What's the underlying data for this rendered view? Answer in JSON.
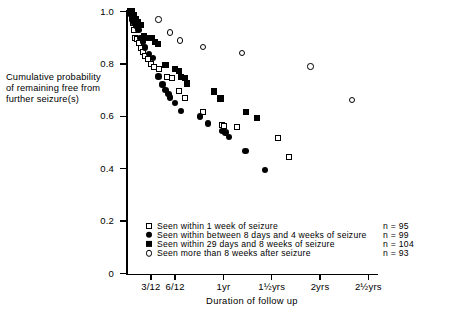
{
  "chart_data": {
    "type": "scatter",
    "title": "",
    "xlabel": "Duration of follow up",
    "ylabel": "Cumulative probability of remaining free from further seizure(s)",
    "ylabel_lines": [
      "Cumulative probability",
      "of remaining free from",
      "further seizure(s)"
    ],
    "ylim": [
      0,
      1.0
    ],
    "ytick_labels": [
      "1.0",
      "0.8",
      "0.6",
      "0.4",
      "0.2",
      "0"
    ],
    "ytick_values": [
      1.0,
      0.8,
      0.6,
      0.4,
      0.2,
      0
    ],
    "xtick_labels": [
      "3/12",
      "6/12",
      "1yr",
      "1½yrs",
      "2yrs",
      "2½yrs"
    ],
    "xtick_values": [
      0.25,
      0.5,
      1.0,
      1.5,
      2.0,
      2.5
    ],
    "xlim": [
      0,
      2.6
    ],
    "grid": false,
    "legend_position": "inside-lower-left",
    "series": [
      {
        "name": "Seen within 1 week of seizure",
        "marker": "open-square",
        "n": 95,
        "points": [
          [
            0.035,
            1.0
          ],
          [
            0.05,
            0.975
          ],
          [
            0.06,
            0.955
          ],
          [
            0.075,
            0.93
          ],
          [
            0.09,
            0.9
          ],
          [
            0.105,
            0.895
          ],
          [
            0.13,
            0.88
          ],
          [
            0.15,
            0.862
          ],
          [
            0.17,
            0.845
          ],
          [
            0.19,
            0.83
          ],
          [
            0.215,
            0.818
          ],
          [
            0.25,
            0.8
          ],
          [
            0.285,
            0.79
          ],
          [
            0.33,
            0.782
          ],
          [
            0.42,
            0.75
          ],
          [
            0.47,
            0.745
          ],
          [
            0.545,
            0.697
          ],
          [
            0.6,
            0.67
          ],
          [
            0.79,
            0.618
          ],
          [
            0.99,
            0.568
          ],
          [
            1.01,
            0.562
          ],
          [
            1.14,
            0.558
          ],
          [
            1.56,
            0.518
          ],
          [
            1.68,
            0.446
          ]
        ]
      },
      {
        "name": "Seen within between 8 days and 4 weeks of seizure",
        "marker": "filled-circle",
        "n": 99,
        "points": [
          [
            0.04,
            0.99
          ],
          [
            0.055,
            0.968
          ],
          [
            0.075,
            0.955
          ],
          [
            0.095,
            0.945
          ],
          [
            0.12,
            0.93
          ],
          [
            0.14,
            0.9
          ],
          [
            0.165,
            0.885
          ],
          [
            0.19,
            0.862
          ],
          [
            0.23,
            0.838
          ],
          [
            0.27,
            0.822
          ],
          [
            0.33,
            0.752
          ],
          [
            0.37,
            0.722
          ],
          [
            0.4,
            0.7
          ],
          [
            0.43,
            0.685
          ],
          [
            0.45,
            0.672
          ],
          [
            0.5,
            0.65
          ],
          [
            0.56,
            0.62
          ],
          [
            0.76,
            0.6
          ],
          [
            0.84,
            0.572
          ],
          [
            0.99,
            0.545
          ],
          [
            1.02,
            0.538
          ],
          [
            1.06,
            0.522
          ],
          [
            1.23,
            0.468
          ],
          [
            1.43,
            0.396
          ]
        ]
      },
      {
        "name": "Seen within 29 days and 8 weeks of seizure",
        "marker": "filled-square",
        "n": 104,
        "points": [
          [
            0.03,
            1.0
          ],
          [
            0.05,
            1.0
          ],
          [
            0.07,
            0.985
          ],
          [
            0.09,
            0.97
          ],
          [
            0.11,
            0.96
          ],
          [
            0.135,
            0.948
          ],
          [
            0.15,
            0.948
          ],
          [
            0.175,
            0.905
          ],
          [
            0.21,
            0.9
          ],
          [
            0.26,
            0.9
          ],
          [
            0.29,
            0.885
          ],
          [
            0.32,
            0.875
          ],
          [
            0.4,
            0.797
          ],
          [
            0.5,
            0.78
          ],
          [
            0.54,
            0.772
          ],
          [
            0.565,
            0.75
          ],
          [
            0.6,
            0.745
          ],
          [
            0.62,
            0.725
          ],
          [
            0.9,
            0.695
          ],
          [
            0.97,
            0.668
          ],
          [
            1.23,
            0.615
          ],
          [
            1.35,
            0.595
          ]
        ]
      },
      {
        "name": "Seen more than 8 weeks after seizure",
        "marker": "open-circle",
        "n": 93,
        "points": [
          [
            0.33,
            0.97
          ],
          [
            0.45,
            0.92
          ],
          [
            0.55,
            0.89
          ],
          [
            0.79,
            0.865
          ],
          [
            1.19,
            0.842
          ],
          [
            1.9,
            0.79
          ],
          [
            2.33,
            0.662
          ]
        ]
      }
    ]
  },
  "legend": {
    "items": [
      {
        "label": "Seen within 1 week of seizure",
        "marker": "open-square",
        "n_text": "n  =  95"
      },
      {
        "label": "Seen within between 8 days and 4 weeks of seizure",
        "marker": "filled-circle",
        "n_text": "n  =  99"
      },
      {
        "label": "Seen within 29 days and 8 weeks of seizure",
        "marker": "filled-square",
        "n_text": "n  =  104"
      },
      {
        "label": "Seen more than 8 weeks after seizure",
        "marker": "open-circle",
        "n_text": "n  =  93"
      }
    ]
  },
  "colors": {
    "foreground": "#000000",
    "background": "#ffffff"
  }
}
